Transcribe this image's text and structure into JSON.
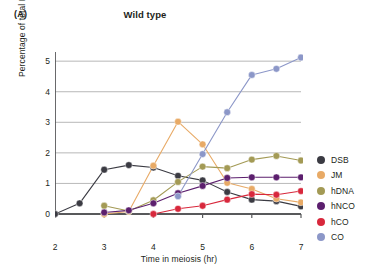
{
  "panel_label": "(A)",
  "title": "Wild type",
  "axes": {
    "xlabel": "Time in meiosis (hr)",
    "ylabel": "Percentage of total DNA",
    "xticks": [
      "2",
      "3",
      "4",
      "5",
      "6",
      "7"
    ],
    "yticks": [
      "0",
      "1",
      "2",
      "3",
      "4",
      "5"
    ]
  },
  "legend": {
    "items": [
      {
        "label": "DSB",
        "color": "#3b3b43"
      },
      {
        "label": "JM",
        "color": "#e8aa66"
      },
      {
        "label": "hDNA",
        "color": "#a39a55"
      },
      {
        "label": "hNCO",
        "color": "#5c1f6e"
      },
      {
        "label": "hCO",
        "color": "#d8283c"
      },
      {
        "label": "CO",
        "color": "#8c97c8"
      }
    ]
  },
  "chart_data": {
    "type": "line",
    "title": "Wild type",
    "xlabel": "Time in meiosis (hr)",
    "ylabel": "Percentage of total DNA",
    "xlim": [
      2,
      7
    ],
    "ylim": [
      0,
      5.3
    ],
    "grid": "horizontal",
    "legend_position": "right",
    "x": [
      2,
      2.5,
      3,
      3.5,
      4,
      4.5,
      5,
      5.5,
      6,
      6.5,
      7
    ],
    "series": [
      {
        "name": "DSB",
        "color": "#3b3b43",
        "x": [
          2,
          2.5,
          3,
          3.5,
          4,
          4.5,
          5,
          5.5,
          6,
          6.5,
          7
        ],
        "values": [
          0,
          0.35,
          1.45,
          1.6,
          1.52,
          1.25,
          1.1,
          0.72,
          0.47,
          0.42,
          0.25
        ]
      },
      {
        "name": "JM",
        "color": "#e8aa66",
        "x": [
          3,
          3.5,
          4,
          4.5,
          5,
          5.5,
          6,
          6.5,
          7
        ],
        "values": [
          0,
          0.08,
          1.58,
          3.02,
          2.28,
          1.02,
          0.82,
          0.5,
          0.38
        ]
      },
      {
        "name": "hDNA",
        "color": "#a39a55",
        "x": [
          3,
          3.5,
          4,
          4.5,
          5,
          5.5,
          6,
          6.5,
          7
        ],
        "values": [
          0.27,
          0.1,
          0.45,
          1.05,
          1.55,
          1.5,
          1.78,
          1.9,
          1.75
        ]
      },
      {
        "name": "hNCO",
        "color": "#5c1f6e",
        "x": [
          3,
          3.5,
          4,
          4.5,
          5,
          5.5,
          6,
          6.5,
          7
        ],
        "values": [
          0.05,
          0.12,
          0.35,
          0.68,
          0.92,
          1.18,
          1.2,
          1.2,
          1.2
        ]
      },
      {
        "name": "hCO",
        "color": "#d8283c",
        "x": [
          4,
          4.5,
          5,
          5.5,
          6,
          6.5,
          7
        ],
        "values": [
          0,
          0.17,
          0.27,
          0.47,
          0.65,
          0.63,
          0.75
        ]
      },
      {
        "name": "CO",
        "color": "#8c97c8",
        "x": [
          4.5,
          5,
          5.5,
          6,
          6.5,
          7
        ],
        "values": [
          0.58,
          1.96,
          3.33,
          4.55,
          4.75,
          5.12
        ]
      }
    ]
  }
}
